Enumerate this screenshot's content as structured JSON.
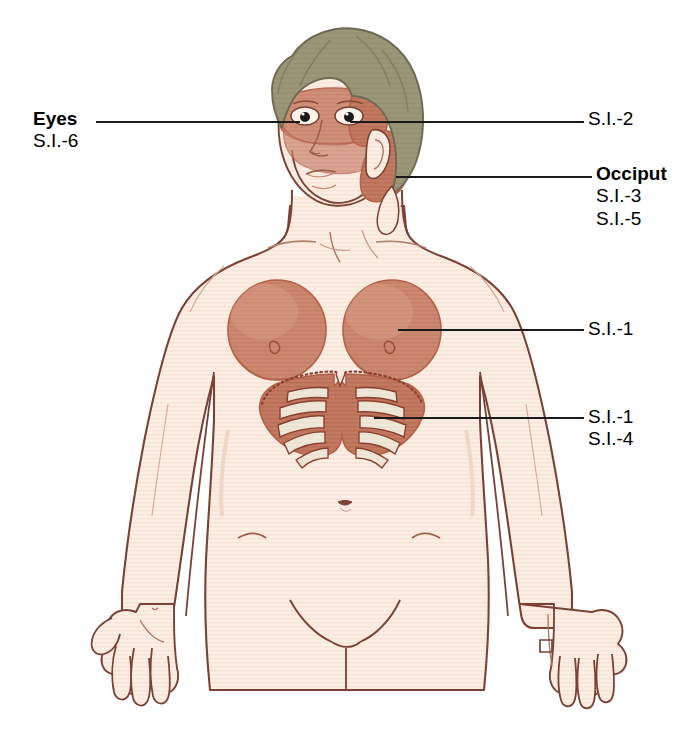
{
  "figure": {
    "colors": {
      "skin": "#fbeee4",
      "skin_shadow": "#f6e0d0",
      "outline": "#7a4234",
      "hair": "#9a9677",
      "hair_outline": "#6e6a52",
      "zone_fill": "#cc8670",
      "zone_dark": "#c07a63",
      "zone_outline": "#b4604a",
      "rib_bone": "#efe7d8",
      "leader_line": "#1a1a1a",
      "background": "#ffffff",
      "pupil": "#1a1a1a"
    }
  },
  "labels": {
    "eyes": {
      "title": "Eyes",
      "codes": [
        "S.I.-6"
      ],
      "side": "left"
    },
    "si2": {
      "title": "",
      "codes": [
        "S.I.-2"
      ],
      "side": "right"
    },
    "occiput": {
      "title": "Occiput",
      "codes": [
        "S.I.-3",
        "S.I.-5"
      ],
      "side": "right"
    },
    "breast": {
      "title": "",
      "codes": [
        "S.I.-1"
      ],
      "side": "right"
    },
    "ribs": {
      "title": "",
      "codes": [
        "S.I.-1",
        "S.I.-4"
      ],
      "side": "right"
    }
  },
  "leader_lines": [
    {
      "name": "eyes-leader",
      "x1": 96,
      "y1": 122,
      "x2": 300,
      "y2": 122
    },
    {
      "name": "si2-leader",
      "x1": 350,
      "y1": 122,
      "x2": 584,
      "y2": 122
    },
    {
      "name": "occiput-leader",
      "x1": 396,
      "y1": 177,
      "x2": 592,
      "y2": 177
    },
    {
      "name": "breast-leader",
      "x1": 398,
      "y1": 330,
      "x2": 584,
      "y2": 330
    },
    {
      "name": "ribs-leader",
      "x1": 374,
      "y1": 418,
      "x2": 584,
      "y2": 418
    }
  ],
  "zones": [
    {
      "name": "periorbital-zone",
      "code": "S.I.-6",
      "region": "eyes"
    },
    {
      "name": "temporal-zone",
      "code": "S.I.-2",
      "region": "temple"
    },
    {
      "name": "occipital-zone",
      "codes": [
        "S.I.-3",
        "S.I.-5"
      ],
      "region": "occiput"
    },
    {
      "name": "breast-zone",
      "code": "S.I.-1",
      "region": "breasts"
    },
    {
      "name": "costal-zone",
      "codes": [
        "S.I.-1",
        "S.I.-4"
      ],
      "region": "ribs"
    }
  ]
}
